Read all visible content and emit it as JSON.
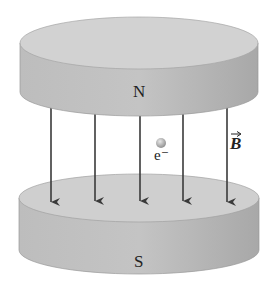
{
  "diagram": {
    "top_magnet": {
      "label": "N"
    },
    "bottom_magnet": {
      "label": "S"
    },
    "particle": {
      "label": "e⁻"
    },
    "field": {
      "label": "B",
      "arrow_count": 5,
      "direction": "down"
    },
    "colors": {
      "magnet_top_face": "#cfcfcf",
      "magnet_side": "#b5b5b5",
      "field_line": "#3a3a3a",
      "particle": "#9a9a9a"
    }
  }
}
